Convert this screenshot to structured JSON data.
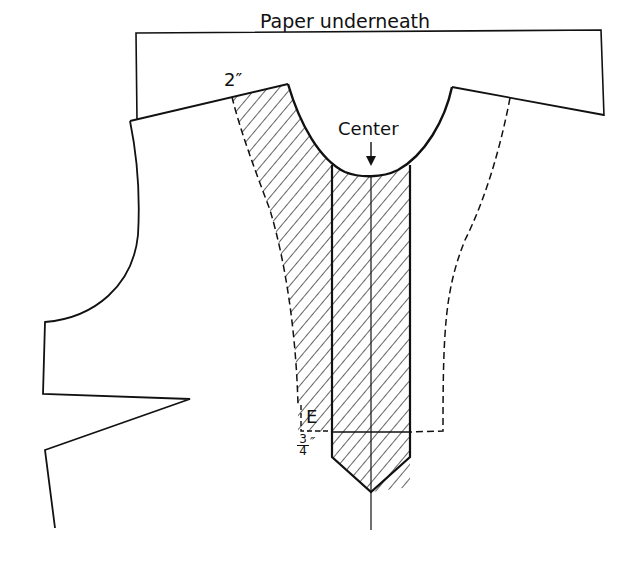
{
  "diagram": {
    "type": "sewing-pattern",
    "labels": {
      "paper": "Paper underneath",
      "extension": "2″",
      "center": "Center",
      "point_e": "E",
      "fraction_num": "3",
      "fraction_den": "4",
      "fraction_unit": "″"
    },
    "colors": {
      "line": "#111111",
      "background": "#ffffff"
    }
  }
}
